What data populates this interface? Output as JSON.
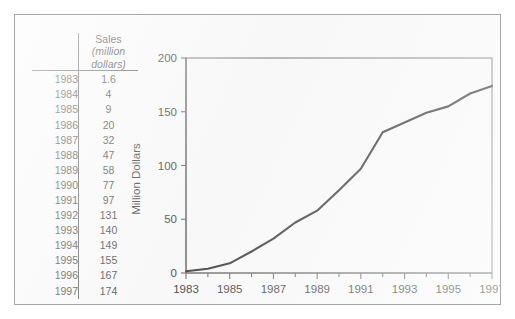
{
  "figure": {
    "background_color": "#f7f7f7",
    "border_color": "#a8a8a8"
  },
  "table": {
    "header": {
      "year_column_label": "",
      "value_line1": "Sales",
      "value_line2": "(million",
      "value_line3": "dollars)"
    },
    "rows": [
      {
        "year": "1983",
        "value": "1.6"
      },
      {
        "year": "1984",
        "value": "4"
      },
      {
        "year": "1985",
        "value": "9"
      },
      {
        "year": "1986",
        "value": "20"
      },
      {
        "year": "1987",
        "value": "32"
      },
      {
        "year": "1988",
        "value": "47"
      },
      {
        "year": "1989",
        "value": "58"
      },
      {
        "year": "1990",
        "value": "77"
      },
      {
        "year": "1991",
        "value": "97"
      },
      {
        "year": "1992",
        "value": "131"
      },
      {
        "year": "1993",
        "value": "140"
      },
      {
        "year": "1994",
        "value": "149"
      },
      {
        "year": "1995",
        "value": "155"
      },
      {
        "year": "1996",
        "value": "167"
      },
      {
        "year": "1997",
        "value": "174"
      }
    ]
  },
  "chart_data": {
    "type": "line",
    "title": "",
    "xlabel": "",
    "ylabel": "Million Dollars",
    "x": [
      1983,
      1984,
      1985,
      1986,
      1987,
      1988,
      1989,
      1990,
      1991,
      1992,
      1993,
      1994,
      1995,
      1996,
      1997
    ],
    "values": [
      1.6,
      4,
      9,
      20,
      32,
      47,
      58,
      77,
      97,
      131,
      140,
      149,
      155,
      167,
      174
    ],
    "series": [
      {
        "name": "Sales (million dollars)",
        "values": [
          1.6,
          4,
          9,
          20,
          32,
          47,
          58,
          77,
          97,
          131,
          140,
          149,
          155,
          167,
          174
        ],
        "color": "#141414"
      }
    ],
    "xlim": [
      1983,
      1997
    ],
    "ylim": [
      0,
      200
    ],
    "x_ticks_major": [
      1983,
      1985,
      1987,
      1989,
      1991,
      1993,
      1995,
      1997
    ],
    "x_ticks_minor": [
      1984,
      1986,
      1988,
      1990,
      1992,
      1994,
      1996
    ],
    "x_tick_labels": [
      "1983",
      "1985",
      "1987",
      "1989",
      "1991",
      "1993",
      "1995",
      "1997"
    ],
    "y_ticks": [
      0,
      50,
      100,
      150,
      200
    ],
    "y_tick_labels": [
      "0",
      "50",
      "100",
      "150",
      "200"
    ],
    "grid": false,
    "legend": false,
    "legend_position": "none",
    "line_color": "#141414",
    "frame": true
  }
}
